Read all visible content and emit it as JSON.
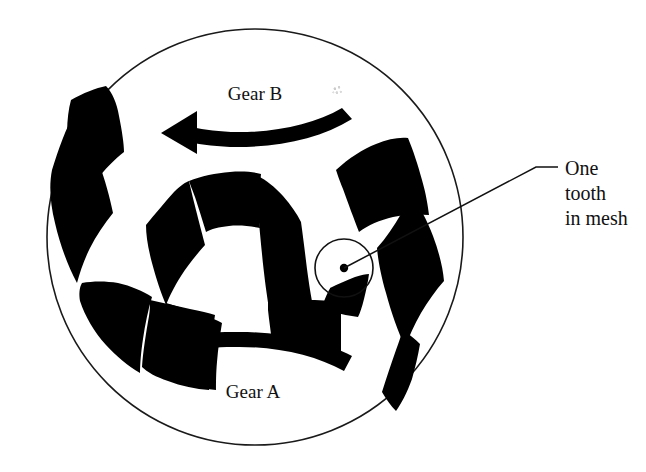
{
  "figure": {
    "type": "mechanical-diagram",
    "background_color": "#ffffff",
    "ink_color": "#000000",
    "outline_color": "#1a1a1a",
    "canvas": {
      "width": 646,
      "height": 472
    }
  },
  "outer_circle": {
    "name": "housing-circle",
    "center_x": 255,
    "center_y": 237,
    "radius": 208,
    "stroke_width": 1.6,
    "filled": false
  },
  "labels": {
    "gear_b": "Gear B",
    "gear_a": "Gear A",
    "callout_line1": "One",
    "callout_line2": "tooth",
    "callout_line3": "in mesh"
  },
  "label_positions": {
    "gear_b": {
      "x": 255,
      "y": 100,
      "anchor": "middle"
    },
    "gear_a": {
      "x": 253,
      "y": 398,
      "anchor": "middle"
    },
    "callout_line1": {
      "x": 565,
      "y": 175,
      "anchor": "start"
    },
    "callout_line2": {
      "x": 565,
      "y": 200,
      "anchor": "start"
    },
    "callout_line3": {
      "x": 565,
      "y": 225,
      "anchor": "start"
    }
  },
  "rotation_arrows": [
    {
      "name": "gear-b-rotation-arrow",
      "for_gear": "Gear B",
      "direction": "counter-clockwise",
      "points_toward": "left",
      "start_x": 352,
      "start_y": 123,
      "end_x": 166,
      "end_y": 116
    },
    {
      "name": "gear-a-rotation-arrow",
      "for_gear": "Gear A",
      "direction": "counter-clockwise",
      "points_toward": "left",
      "start_x": 352,
      "start_y": 356,
      "end_x": 166,
      "end_y": 357
    }
  ],
  "mesh_marker": {
    "name": "mesh-highlight-circle",
    "center_x": 344,
    "center_y": 268,
    "radius": 29,
    "dot_radius": 4.2,
    "stroke_width": 1.6
  },
  "leader_line": {
    "name": "callout-leader-line",
    "points": [
      {
        "x": 344,
        "y": 268
      },
      {
        "x": 536,
        "y": 167
      },
      {
        "x": 558,
        "y": 167
      }
    ],
    "stroke_width": 1.5
  },
  "gears": [
    {
      "name": "gear-b-ring-teeth",
      "role": "outer ring gear (internal teeth)",
      "description": "broad black arc segments around the left and right of the housing circle"
    },
    {
      "name": "gear-a-pinion-teeth",
      "role": "inner pinion gear (external teeth)",
      "description": "black lobed tooth forms clustered near the centre of the housing circle"
    }
  ],
  "notes": {
    "smudge": "faint ink smudge artifact right of the Gear B label"
  }
}
